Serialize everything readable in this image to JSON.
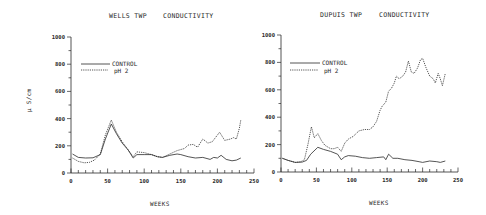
{
  "chart_data": [
    {
      "type": "line",
      "title": "WELLS TWP    CONDUCTIVITY",
      "title_parts": [
        "WELLS TWP",
        "CONDUCTIVITY"
      ],
      "xlabel": "WEEKS",
      "ylabel": "µ S/cm",
      "xlim": [
        0,
        250
      ],
      "ylim": [
        0,
        1000
      ],
      "xticks": [
        0,
        50,
        100,
        150,
        200,
        250
      ],
      "yticks": [
        0,
        200,
        400,
        600,
        800,
        1000
      ],
      "grid": false,
      "legend_position": "upper left",
      "series": [
        {
          "name": "CONTROL",
          "style": "solid",
          "x": [
            2,
            10,
            20,
            30,
            40,
            47,
            55,
            62,
            70,
            78,
            85,
            90,
            100,
            110,
            118,
            125,
            135,
            145,
            150,
            160,
            170,
            180,
            190,
            195,
            200,
            205,
            212,
            220,
            226,
            232
          ],
          "y": [
            140,
            115,
            110,
            112,
            135,
            250,
            360,
            290,
            220,
            170,
            110,
            135,
            135,
            135,
            120,
            115,
            130,
            140,
            135,
            120,
            110,
            115,
            100,
            115,
            110,
            130,
            100,
            90,
            95,
            110
          ]
        },
        {
          "name": "pH 2",
          "style": "dashed",
          "x": [
            2,
            10,
            18,
            25,
            32,
            40,
            47,
            55,
            62,
            70,
            78,
            85,
            90,
            100,
            110,
            118,
            125,
            135,
            145,
            155,
            160,
            167,
            173,
            180,
            187,
            193,
            203,
            210,
            218,
            222,
            226,
            230,
            232
          ],
          "y": [
            110,
            85,
            75,
            78,
            95,
            140,
            280,
            390,
            300,
            230,
            170,
            120,
            155,
            150,
            135,
            120,
            115,
            140,
            165,
            180,
            205,
            210,
            190,
            250,
            220,
            230,
            300,
            240,
            250,
            260,
            250,
            330,
            390
          ]
        }
      ]
    },
    {
      "type": "line",
      "title": "DUPUIS TWP    CONDUCTIVITY",
      "title_parts": [
        "DUPUIS TWP",
        "CONDUCTIVITY"
      ],
      "xlabel": "WEEKS",
      "ylabel": "",
      "xlim": [
        0,
        250
      ],
      "ylim": [
        0,
        1000
      ],
      "xticks": [
        0,
        50,
        100,
        150,
        200,
        250
      ],
      "yticks": [
        0,
        200,
        400,
        600,
        800,
        1000
      ],
      "grid": false,
      "legend_position": "upper left",
      "series": [
        {
          "name": "CONTROL",
          "style": "solid",
          "x": [
            2,
            10,
            20,
            30,
            36,
            42,
            52,
            60,
            70,
            80,
            85,
            90,
            95,
            105,
            115,
            125,
            135,
            145,
            148,
            152,
            158,
            165,
            175,
            185,
            195,
            200,
            210,
            220,
            225,
            232
          ],
          "y": [
            100,
            85,
            70,
            72,
            85,
            130,
            180,
            165,
            150,
            130,
            90,
            110,
            120,
            115,
            105,
            100,
            105,
            110,
            90,
            130,
            100,
            100,
            90,
            85,
            75,
            70,
            80,
            75,
            70,
            80
          ]
        },
        {
          "name": "pH 2",
          "style": "dashed",
          "x": [
            2,
            10,
            20,
            28,
            33,
            38,
            43,
            47,
            52,
            57,
            62,
            70,
            75,
            80,
            85,
            90,
            95,
            102,
            110,
            118,
            125,
            130,
            135,
            140,
            143,
            148,
            152,
            156,
            160,
            163,
            167,
            172,
            176,
            180,
            184,
            188,
            193,
            197,
            200,
            205,
            210,
            215,
            218,
            222,
            225,
            228,
            232
          ],
          "y": [
            100,
            85,
            70,
            75,
            90,
            200,
            330,
            250,
            280,
            230,
            195,
            170,
            170,
            180,
            150,
            210,
            240,
            260,
            300,
            310,
            310,
            330,
            370,
            450,
            480,
            510,
            590,
            610,
            650,
            700,
            680,
            700,
            730,
            810,
            730,
            720,
            760,
            820,
            830,
            760,
            700,
            680,
            650,
            720,
            680,
            630,
            720
          ]
        }
      ]
    }
  ],
  "charts": [
    {
      "title_left": "WELLS TWP",
      "title_right": "CONDUCTIVITY",
      "xlabel": "WEEKS",
      "ylabel": "µ S/cm",
      "legend": [
        "CONTROL",
        "pH 2"
      ],
      "xtick_labels": [
        "0",
        "50",
        "100",
        "150",
        "200",
        "250"
      ],
      "ytick_labels": [
        "0",
        "200",
        "400",
        "600",
        "800",
        "1000"
      ]
    },
    {
      "title_left": "DUPUIS TWP",
      "title_right": "CONDUCTIVITY",
      "xlabel": "WEEKS",
      "ylabel": "",
      "legend": [
        "CONTROL",
        "pH 2"
      ],
      "xtick_labels": [
        "0",
        "50",
        "100",
        "150",
        "200",
        "250"
      ],
      "ytick_labels": [
        "0",
        "200",
        "400",
        "600",
        "800",
        "1000"
      ]
    }
  ],
  "colors": {
    "ink": "#2a2a2a",
    "background": "#ffffff"
  }
}
